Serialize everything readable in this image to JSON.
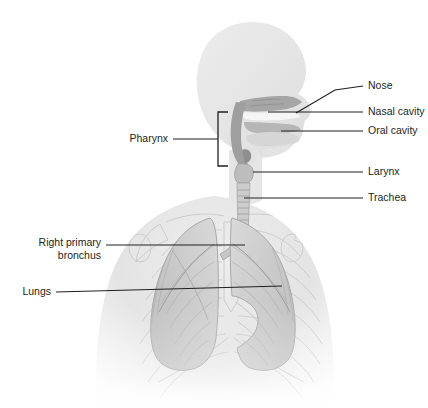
{
  "figure": {
    "background_color": "#ffffff",
    "line_color": "#231f20",
    "body_fill": "#e9e9e9",
    "body_shade": "#d8d8d8",
    "cavity_fill": "#a9a9a9",
    "lung_fill": "#cfcfcf",
    "bone_stroke": "#c9c9c9"
  },
  "labels": [
    {
      "id": "nose",
      "text": "Nose",
      "side": "right",
      "text_x": 368,
      "text_y": 86,
      "leader": "M 363 86 L 335 90 L 296 113"
    },
    {
      "id": "nasal-cavity",
      "text": "Nasal cavity",
      "side": "right",
      "text_x": 368,
      "text_y": 112,
      "leader": "M 363 112 L 268 112"
    },
    {
      "id": "oral-cavity",
      "text": "Oral cavity",
      "side": "right",
      "text_x": 368,
      "text_y": 131,
      "leader": "M 363 131 L 281 131"
    },
    {
      "id": "larynx",
      "text": "Larynx",
      "side": "right",
      "text_x": 368,
      "text_y": 172,
      "leader": "M 363 172 L 253 172"
    },
    {
      "id": "trachea",
      "text": "Trachea",
      "side": "right",
      "text_x": 368,
      "text_y": 198,
      "leader": "M 363 198 L 244 198"
    },
    {
      "id": "pharynx",
      "text": "Pharynx",
      "side": "left",
      "text_x": 168,
      "text_y": 139,
      "leader": "M 173 139 L 218 139",
      "bracket": "M 228 112 L 218 112 L 218 166 L 228 166"
    },
    {
      "id": "right-primary-bronchus",
      "text": "Right primary",
      "text_line2": "bronchus",
      "side": "left",
      "text_x": 101,
      "text_y": 243,
      "text_y2": 256,
      "leader": "M 106 245 L 245 245"
    },
    {
      "id": "lungs",
      "text": "Lungs",
      "side": "left",
      "text_x": 51,
      "text_y": 292,
      "leader": "M 56 292 L 282 286"
    }
  ]
}
